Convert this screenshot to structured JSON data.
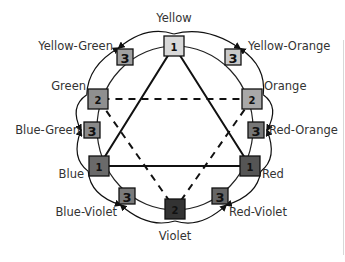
{
  "diagram": {
    "legend_levels": {
      "1": "primary",
      "2": "secondary",
      "3": "tertiary"
    },
    "nodes": [
      {
        "id": "yellow",
        "label": "Yellow",
        "level": "1",
        "fill": "#d9d9d9",
        "cx": 174,
        "cy": 46,
        "lx": 174,
        "ly": 22,
        "anchor": "middle"
      },
      {
        "id": "yellow-orange",
        "label": "Yellow-Orange",
        "level": "3",
        "fill": "#c8c8c8",
        "cx": 233,
        "cy": 57,
        "lx": 248,
        "ly": 50,
        "anchor": "start"
      },
      {
        "id": "orange",
        "label": "Orange",
        "level": "2",
        "fill": "#a8a8a8",
        "cx": 252,
        "cy": 99,
        "lx": 264,
        "ly": 90,
        "anchor": "start"
      },
      {
        "id": "red-orange",
        "label": "Red-Orange",
        "level": "3",
        "fill": "#777777",
        "cx": 256,
        "cy": 130,
        "lx": 269,
        "ly": 134,
        "anchor": "start"
      },
      {
        "id": "red",
        "label": "Red",
        "level": "1",
        "fill": "#555555",
        "cx": 250,
        "cy": 166,
        "lx": 262,
        "ly": 178,
        "anchor": "start"
      },
      {
        "id": "red-violet",
        "label": "Red-Violet",
        "level": "3",
        "fill": "#666666",
        "cx": 220,
        "cy": 196,
        "lx": 229,
        "ly": 216,
        "anchor": "start"
      },
      {
        "id": "violet",
        "label": "Violet",
        "level": "2",
        "fill": "#333333",
        "cx": 175,
        "cy": 209,
        "lx": 175,
        "ly": 240,
        "anchor": "middle"
      },
      {
        "id": "blue-violet",
        "label": "Blue-Violet",
        "level": "3",
        "fill": "#7a7a7a",
        "cx": 127,
        "cy": 196,
        "lx": 117,
        "ly": 216,
        "anchor": "end"
      },
      {
        "id": "blue",
        "label": "Blue",
        "level": "1",
        "fill": "#6a6a6a",
        "cx": 99,
        "cy": 166,
        "lx": 84,
        "ly": 178,
        "anchor": "end"
      },
      {
        "id": "blue-green",
        "label": "Blue-Green",
        "level": "3",
        "fill": "#8a8a8a",
        "cx": 92,
        "cy": 130,
        "lx": 80,
        "ly": 134,
        "anchor": "end"
      },
      {
        "id": "green",
        "label": "Green",
        "level": "2",
        "fill": "#8f8f8f",
        "cx": 98,
        "cy": 99,
        "lx": 86,
        "ly": 90,
        "anchor": "end"
      },
      {
        "id": "yellow-green",
        "label": "Yellow-Green",
        "level": "3",
        "fill": "#a0a0a0",
        "cx": 125,
        "cy": 57,
        "lx": 113,
        "ly": 50,
        "anchor": "end"
      }
    ],
    "primary_triangle": [
      "yellow",
      "red",
      "blue"
    ],
    "secondary_triangle": [
      "orange",
      "violet",
      "green"
    ],
    "colors": {
      "line": "#111111",
      "circle": "#222222",
      "label_text": "#333333",
      "background": "#ffffff"
    }
  }
}
